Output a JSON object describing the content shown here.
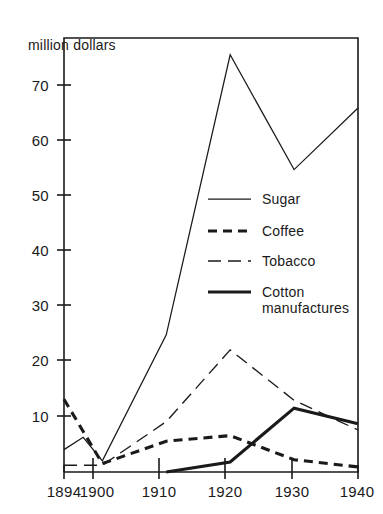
{
  "chart_data": {
    "type": "line",
    "title": "",
    "ylabel": "million dollars",
    "xlabel": "",
    "x": [
      1894,
      1900,
      1910,
      1920,
      1930,
      1940
    ],
    "xtick_labels": [
      "1894",
      "1900",
      "1910",
      "1920",
      "1930",
      "1940"
    ],
    "ytick_labels": [
      "10",
      "20",
      "30",
      "40",
      "50",
      "60",
      "70"
    ],
    "yticks": [
      10,
      20,
      30,
      40,
      50,
      60,
      70
    ],
    "xlim": [
      1894,
      1940
    ],
    "ylim": [
      0,
      78
    ],
    "grid": false,
    "legend_position": "center-right",
    "series": [
      {
        "name": "Sugar",
        "style": "thin-solid",
        "x": [
          1894,
          1897,
          1900,
          1910,
          1920,
          1930,
          1940
        ],
        "values": [
          4.0,
          6.2,
          2.0,
          24.5,
          74.5,
          54.0,
          65.0
        ]
      },
      {
        "name": "Coffee",
        "style": "bold-short-dash",
        "x": [
          1894,
          1900,
          1910,
          1920,
          1930,
          1940
        ],
        "values": [
          13.0,
          1.5,
          5.5,
          6.5,
          2.2,
          0.9
        ]
      },
      {
        "name": "Tobacco",
        "style": "thin-long-dash",
        "x": [
          1894,
          1900,
          1910,
          1920,
          1930,
          1940
        ],
        "values": [
          1.2,
          1.2,
          9.0,
          21.8,
          12.8,
          7.5
        ]
      },
      {
        "name": "Cotton manufactures",
        "style": "bold-solid",
        "x": [
          1910,
          1920,
          1930,
          1940
        ],
        "values": [
          0.0,
          1.8,
          11.4,
          8.6
        ]
      }
    ]
  },
  "legend": {
    "entries": [
      {
        "label": "Sugar",
        "style": "thin-solid"
      },
      {
        "label": "Coffee",
        "style": "bold-short-dash"
      },
      {
        "label": "Tobacco",
        "style": "thin-long-dash"
      },
      {
        "label_line1": "Cotton",
        "label_line2": "manufactures",
        "style": "bold-solid"
      }
    ]
  },
  "colors": {
    "ink": "#1a1a1a",
    "background": "#ffffff"
  }
}
